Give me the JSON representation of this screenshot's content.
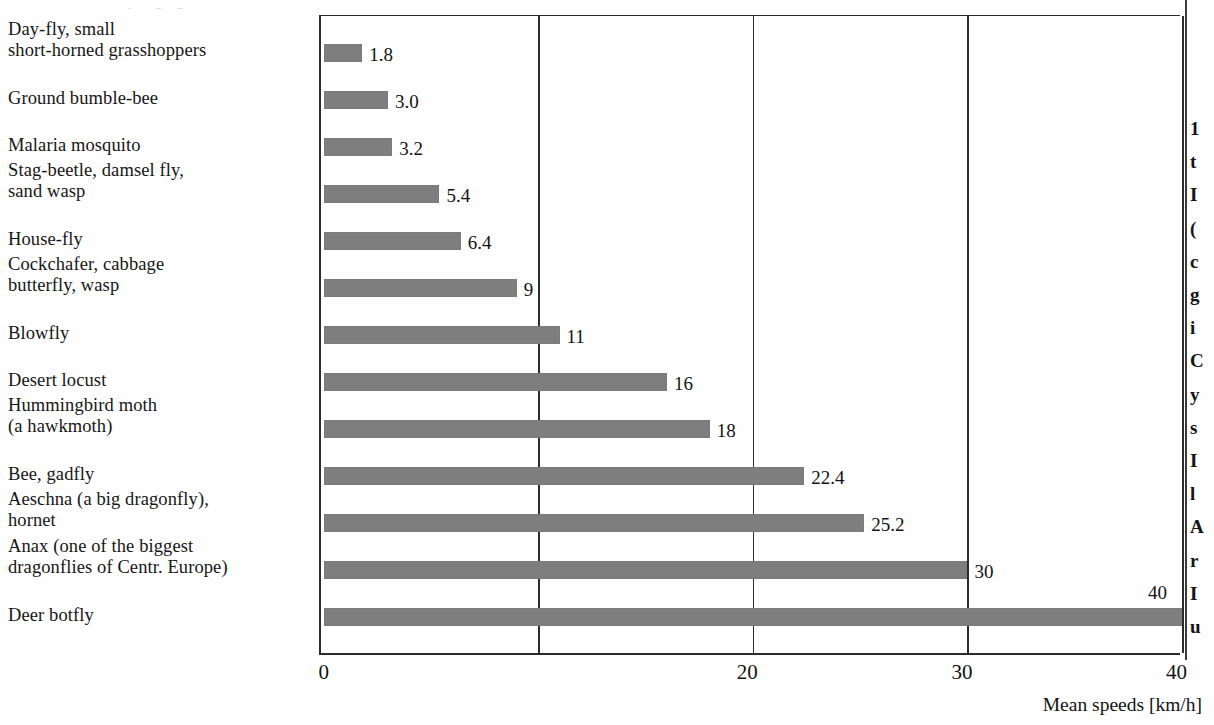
{
  "page": {
    "cut_off_heading": "Mean flying speeds of insects",
    "background_color": "#fefefe",
    "bar_color": "#7e7e7e",
    "axis_color": "#2b2b2b",
    "text_color": "#131313"
  },
  "chart_data": {
    "type": "bar",
    "orientation": "horizontal",
    "title": "",
    "xlabel": "Mean speeds [km/h]",
    "ylabel": "",
    "xlim": [
      0,
      40
    ],
    "grid": true,
    "gridlines": [
      10,
      20,
      30,
      40
    ],
    "tick_labels": [
      "0",
      "20",
      "30",
      "40"
    ],
    "tick_values": [
      0,
      20,
      30,
      40
    ],
    "categories": [
      "Day-fly, small short-horned grasshoppers",
      "Ground bumble-bee",
      "Malaria mosquito",
      "Stag-beetle, damsel fly, sand wasp",
      "House-fly",
      "Cockchafer, cabbage butterfly, wasp",
      "Blowfly",
      "Desert locust",
      "Hummingbird moth (a hawkmoth)",
      "Bee, gadfly",
      "Aeschna (a big dragonfly), hornet",
      "Anax (one of the biggest dragonflies of Centr. Europe)",
      "Deer botfly"
    ],
    "values": [
      1.8,
      3.0,
      3.2,
      5.4,
      6.4,
      9,
      11,
      16,
      18,
      22.4,
      25.2,
      30,
      40
    ],
    "value_labels": [
      "1.8",
      "3.0",
      "3.2",
      "5.4",
      "6.4",
      "9",
      "11",
      "16",
      "18",
      "22.4",
      "25.2",
      "30",
      "40"
    ]
  },
  "category_lines": [
    [
      "Day-fly, small",
      "short-horned grasshoppers"
    ],
    [
      "Ground bumble-bee"
    ],
    [
      "Malaria mosquito"
    ],
    [
      "Stag-beetle, damsel fly,",
      "sand wasp"
    ],
    [
      "House-fly"
    ],
    [
      "Cockchafer, cabbage",
      "butterfly, wasp"
    ],
    [
      "Blowfly"
    ],
    [
      "Desert locust"
    ],
    [
      "Hummingbird moth",
      "(a hawkmoth)"
    ],
    [
      "Bee, gadfly"
    ],
    [
      "Aeschna (a big dragonfly),",
      "hornet"
    ],
    [
      "Anax (one of the biggest",
      "dragonflies of Centr. Europe)"
    ],
    [
      "Deer botfly"
    ]
  ],
  "right_column_fragments": [
    "1",
    "t",
    "I",
    "(",
    "c",
    "g",
    "i",
    "C",
    "y",
    "s",
    "I",
    "l",
    "A",
    "r",
    "I",
    "u",
    "s"
  ]
}
